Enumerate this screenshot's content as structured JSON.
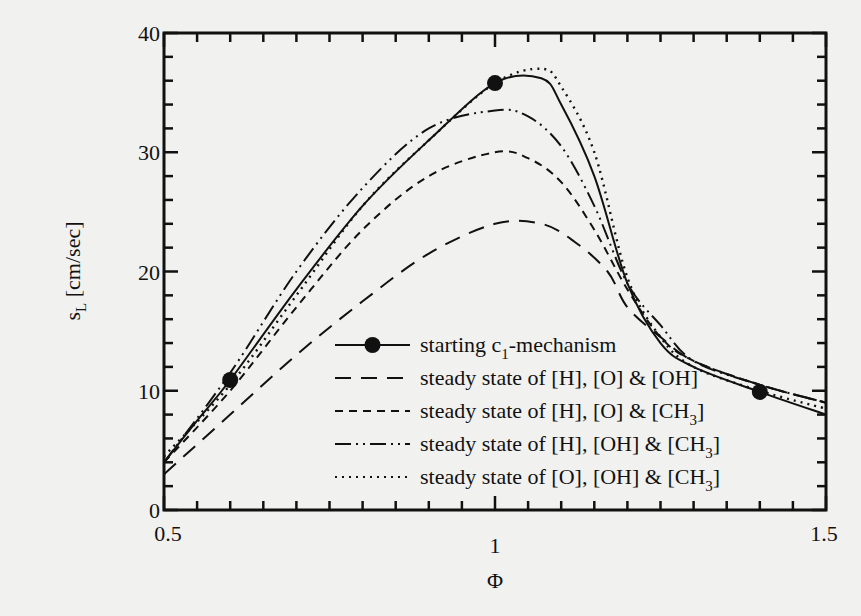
{
  "chart_data": {
    "type": "line",
    "title": "",
    "xlabel": "Φ",
    "ylabel": "s_L [cm/sec]",
    "ylabel_main": "s",
    "ylabel_sub": "L",
    "ylabel_unit": " [cm/sec]",
    "xlim": [
      0.5,
      1.5
    ],
    "ylim": [
      0,
      40
    ],
    "x_ticks": [
      {
        "value": 0.5,
        "label": "0.5"
      },
      {
        "value": 1.0,
        "label": "1"
      },
      {
        "value": 1.5,
        "label": "1.5"
      }
    ],
    "y_ticks": [
      {
        "value": 0,
        "label": "0"
      },
      {
        "value": 10,
        "label": "10"
      },
      {
        "value": 20,
        "label": "20"
      },
      {
        "value": 30,
        "label": "30"
      },
      {
        "value": 40,
        "label": "40"
      }
    ],
    "x_minor_step": 0.05,
    "y_minor_step": 2,
    "grid": false,
    "legend_position": "center-lower",
    "series": [
      {
        "name": "starting c1-mechanism",
        "legend_main": "starting c",
        "legend_sub": "1",
        "legend_tail": "-mechanism",
        "style": "solid",
        "markers": [
          [
            0.6,
            10.9
          ],
          [
            1.0,
            35.8
          ],
          [
            1.4,
            9.9
          ]
        ],
        "x": [
          0.5,
          0.55,
          0.6,
          0.7,
          0.8,
          0.9,
          1.0,
          1.07,
          1.1,
          1.15,
          1.2,
          1.25,
          1.3,
          1.4,
          1.5
        ],
        "values": [
          4.0,
          7.5,
          10.9,
          18.5,
          25.5,
          31.0,
          35.8,
          36.2,
          34.0,
          28.0,
          19.0,
          14.0,
          12.0,
          9.9,
          8.0
        ]
      },
      {
        "name": "steady state of [H], [O] & [OH]",
        "legend_main": "steady state of [H], [O] & [OH]",
        "style": "long-dash",
        "x": [
          0.5,
          0.6,
          0.7,
          0.8,
          0.9,
          1.0,
          1.07,
          1.12,
          1.17,
          1.2,
          1.25,
          1.3,
          1.4,
          1.5
        ],
        "values": [
          3.0,
          8.0,
          13.0,
          17.5,
          21.5,
          24.0,
          24.0,
          22.5,
          20.0,
          17.0,
          14.5,
          12.5,
          10.5,
          9.0
        ]
      },
      {
        "name": "steady state of [H], [O] & [CH3]",
        "legend_main": "steady state of [H], [O] & [CH",
        "legend_sub": "3",
        "legend_tail": "]",
        "style": "short-dash",
        "x": [
          0.5,
          0.6,
          0.7,
          0.8,
          0.9,
          1.0,
          1.05,
          1.1,
          1.15,
          1.2,
          1.25,
          1.3,
          1.4,
          1.5
        ],
        "values": [
          4.0,
          10.0,
          17.0,
          23.5,
          28.0,
          30.0,
          29.5,
          27.5,
          23.5,
          18.5,
          14.5,
          12.5,
          10.5,
          9.0
        ]
      },
      {
        "name": "steady state of [H], [OH] & [CH3]",
        "legend_main": "steady state of [H], [OH] & [CH",
        "legend_sub": "3",
        "legend_tail": "]",
        "style": "dash-dot-dot",
        "x": [
          0.5,
          0.6,
          0.7,
          0.8,
          0.9,
          1.0,
          1.05,
          1.1,
          1.15,
          1.2,
          1.25,
          1.3,
          1.4,
          1.5
        ],
        "values": [
          4.0,
          11.5,
          20.0,
          27.0,
          32.0,
          33.5,
          33.0,
          30.5,
          25.5,
          19.0,
          15.5,
          12.5,
          10.5,
          9.0
        ]
      },
      {
        "name": "steady state of [O], [OH] & [CH3]",
        "legend_main": "steady state of [O], [OH] & [CH",
        "legend_sub": "3",
        "legend_tail": "]",
        "style": "dotted",
        "x": [
          0.5,
          0.6,
          0.7,
          0.8,
          0.9,
          1.0,
          1.07,
          1.1,
          1.15,
          1.2,
          1.25,
          1.3,
          1.4,
          1.5
        ],
        "values": [
          4.5,
          10.5,
          18.0,
          25.5,
          31.0,
          35.8,
          37.0,
          35.5,
          30.0,
          19.5,
          14.5,
          12.0,
          10.0,
          8.5
        ]
      }
    ]
  }
}
